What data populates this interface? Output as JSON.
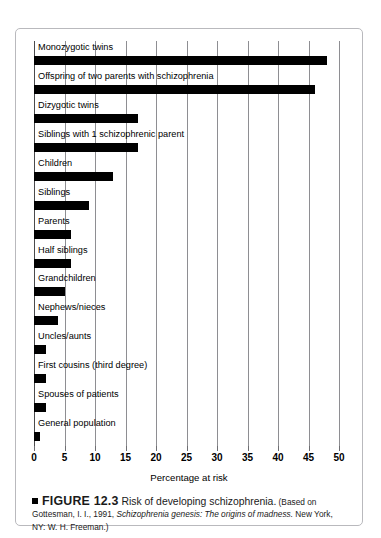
{
  "figure": {
    "marker_icon": "black-square-icon",
    "number_label": "FIGURE 12.3",
    "headline": "Risk of developing schizophrenia.",
    "source_prefix": "(Based on Gottesman, I. I., 1991, ",
    "source_italic_1": "Schizophrenia genesis: The origins of madness.",
    "source_suffix": " New York, NY: W. H. Freeman.)"
  },
  "chart_data": {
    "type": "bar",
    "orientation": "horizontal",
    "title": "Risk of developing schizophrenia.",
    "xlabel": "Percentage at risk",
    "ylabel": "",
    "xlim": [
      0,
      50
    ],
    "xticks": [
      0,
      5,
      10,
      15,
      20,
      25,
      30,
      35,
      40,
      45,
      50
    ],
    "xtick_labels": [
      "0",
      "5",
      "10",
      "15",
      "20",
      "25",
      "30",
      "35",
      "40",
      "45",
      "50"
    ],
    "grid": true,
    "legend": false,
    "bar_color": "#000000",
    "categories": [
      "Monozygotic twins",
      "Offspring of two parents with schizophrenia",
      "Dizygotic twins",
      "Siblings with 1 schizophrenic parent",
      "Children",
      "Siblings",
      "Parents",
      "Half siblings",
      "Grandchildren",
      "Nephews/nieces",
      "Uncles/aunts",
      "First cousins (third degree)",
      "Spouses of patients",
      "General population"
    ],
    "values": [
      48,
      46,
      17,
      17,
      13,
      9,
      6,
      6,
      5,
      4,
      2,
      2,
      2,
      1
    ]
  }
}
